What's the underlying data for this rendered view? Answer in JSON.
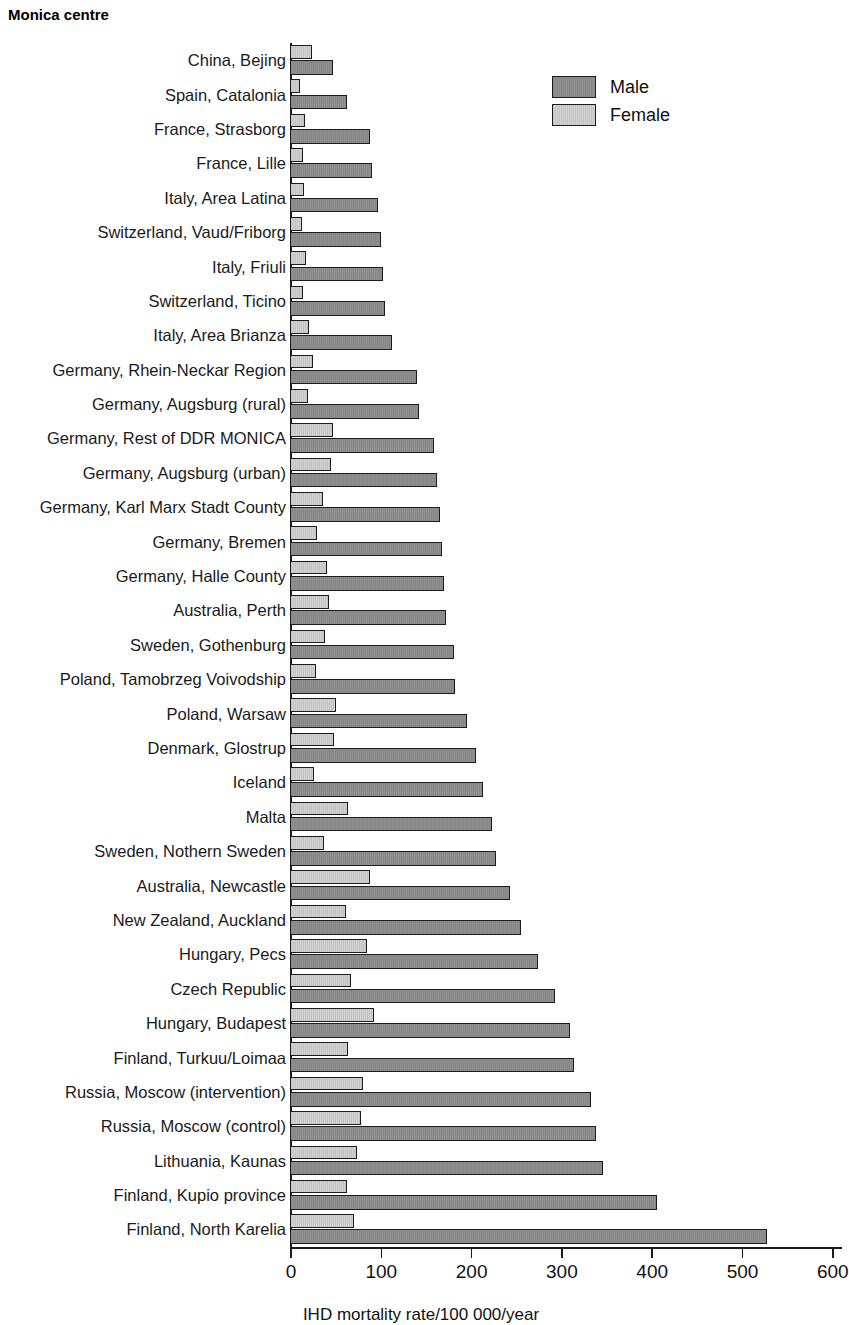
{
  "chart_title": "Monica centre",
  "legend": {
    "position": "top-right",
    "entries": [
      {
        "name": "Male",
        "color": "#8f8f8f"
      },
      {
        "name": "Female",
        "color": "#d2d2d2"
      }
    ]
  },
  "axis": {
    "x_title": "IHD mortality rate/100 000/year",
    "ticks": [
      0,
      100,
      200,
      300,
      400,
      500,
      600
    ],
    "tick_labels": [
      "0",
      "100",
      "200",
      "300",
      "400",
      "500",
      "600"
    ],
    "xlim": [
      0,
      600
    ],
    "grid": false
  },
  "chart_data": {
    "type": "bar",
    "orientation": "horizontal",
    "title": "Monica centre",
    "xlabel": "IHD mortality rate/100 000/year",
    "ylabel": "Monica centre",
    "xlim": [
      0,
      600
    ],
    "xticks": [
      0,
      100,
      200,
      300,
      400,
      500,
      600
    ],
    "grid": false,
    "legend": [
      "Male",
      "Female"
    ],
    "legend_position": "top-right",
    "categories": [
      "China, Bejing",
      "Spain, Catalonia",
      "France, Strasborg",
      "France, Lille",
      "Italy, Area Latina",
      "Switzerland, Vaud/Friborg",
      "Italy, Friuli",
      "Switzerland, Ticino",
      "Italy, Area Brianza",
      "Germany, Rhein-Neckar Region",
      "Germany, Augsburg (rural)",
      "Germany, Rest of DDR MONICA",
      "Germany, Augsburg (urban)",
      "Germany, Karl Marx Stadt County",
      "Germany, Bremen",
      "Germany, Halle County",
      "Australia, Perth",
      "Sweden, Gothenburg",
      "Poland, Tamobrzeg Voivodship",
      "Poland, Warsaw",
      "Denmark, Glostrup",
      "Iceland",
      "Malta",
      "Sweden, Nothern Sweden",
      "Australia, Newcastle",
      "New Zealand, Auckland",
      "Hungary, Pecs",
      "Czech Republic",
      "Hungary, Budapest",
      "Finland, Turkuu/Loimaa",
      "Russia, Moscow (intervention)",
      "Russia, Moscow (control)",
      "Lithuania, Kaunas",
      "Finland, Kupio province",
      "Finland, North Karelia"
    ],
    "series": [
      {
        "name": "Male",
        "color": "#8f8f8f",
        "values": [
          46,
          62,
          88,
          90,
          96,
          100,
          102,
          104,
          112,
          140,
          142,
          158,
          162,
          165,
          167,
          169,
          172,
          180,
          182,
          195,
          205,
          213,
          223,
          227,
          243,
          255,
          273,
          292,
          309,
          313,
          332,
          338,
          345,
          405,
          527
        ]
      },
      {
        "name": "Female",
        "color": "#d2d2d2",
        "values": [
          23,
          10,
          15,
          13,
          14,
          12,
          17,
          13,
          20,
          24,
          19,
          46,
          44,
          35,
          29,
          40,
          42,
          38,
          28,
          50,
          48,
          25,
          63,
          37,
          88,
          61,
          84,
          66,
          92,
          63,
          80,
          78,
          73,
          62,
          70
        ]
      }
    ]
  }
}
